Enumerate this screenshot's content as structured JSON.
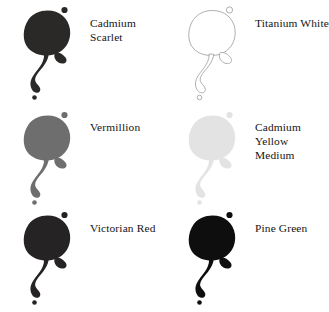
{
  "chart_type": "color-swatch-chart",
  "background_color": "#ffffff",
  "label_color": "#141414",
  "swatches": [
    {
      "name": "Cadmium Scarlet",
      "label": "Cadmium Scarlet",
      "fill": "#2b2927",
      "stroke": "none",
      "stroke_width": "0",
      "row": 1,
      "column": 1
    },
    {
      "name": "Titanium White",
      "label": "Titanium White",
      "fill": "#ffffff",
      "stroke": "#9a9a9a",
      "stroke_width": "0.8",
      "row": 1,
      "column": 2
    },
    {
      "name": "Vermillion",
      "label": "Vermillion",
      "fill": "#6e6e6e",
      "stroke": "none",
      "stroke_width": "0",
      "row": 2,
      "column": 1
    },
    {
      "name": "Cadmium Yellow Medium",
      "label": "Cadmium Yellow\nMedium",
      "fill": "#e3e3e3",
      "stroke": "none",
      "stroke_width": "0",
      "row": 2,
      "column": 2
    },
    {
      "name": "Victorian Red",
      "label": "Victorian Red",
      "fill": "#252324",
      "stroke": "none",
      "stroke_width": "0",
      "row": 3,
      "column": 1
    },
    {
      "name": "Pine Green",
      "label": "Pine Green",
      "fill": "#0e0e0e",
      "stroke": "none",
      "stroke_width": "0",
      "row": 3,
      "column": 2
    }
  ]
}
